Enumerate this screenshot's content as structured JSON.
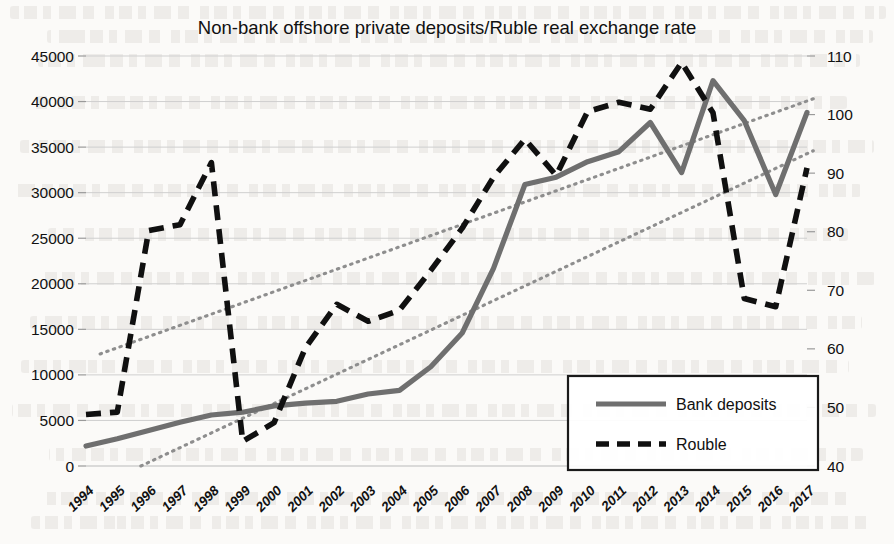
{
  "chart_data": {
    "type": "line",
    "title": "Non-bank offshore private deposits/Ruble real exchange rate",
    "xlabel": "",
    "ylabel": "",
    "grid": true,
    "legend_position": "bottom-right",
    "categories": [
      "1994",
      "1995",
      "1996",
      "1997",
      "1998",
      "1999",
      "2000",
      "2001",
      "2002",
      "2003",
      "2004",
      "2005",
      "2006",
      "2007",
      "2008",
      "2009",
      "2010",
      "2011",
      "2012",
      "2013",
      "2014",
      "2015",
      "2016",
      "2017"
    ],
    "y_left": {
      "label": "",
      "ticks": [
        "0",
        "5000",
        "10000",
        "15000",
        "20000",
        "25000",
        "30000",
        "35000",
        "40000",
        "45000"
      ],
      "lim": [
        0,
        45000
      ]
    },
    "y_right": {
      "label": "",
      "ticks": [
        "40",
        "50",
        "60",
        "70",
        "80",
        "90",
        "100",
        "110"
      ],
      "lim": [
        40,
        110
      ]
    },
    "series": [
      {
        "name": "Bank deposits",
        "axis": "left",
        "style": "solid",
        "color": "#6f6f6f",
        "values": [
          2200,
          3000,
          3900,
          4800,
          5600,
          5900,
          6600,
          6900,
          7100,
          7900,
          8300,
          10900,
          14600,
          21700,
          30900,
          31700,
          33400,
          34500,
          37700,
          32200,
          42300,
          37900,
          29800,
          38800
        ]
      },
      {
        "name": "Rouble",
        "axis": "right",
        "style": "dashed",
        "color": "#101010",
        "values": [
          48.8,
          49.2,
          80.2,
          81.2,
          91.8,
          44.2,
          47.4,
          60.2,
          67.6,
          64.7,
          66.6,
          73.4,
          80.6,
          89.3,
          95.8,
          89.6,
          100.5,
          102.1,
          100.9,
          108.9,
          100.3,
          68.6,
          67.2,
          90.9
        ]
      }
    ],
    "trendlines": [
      {
        "name": "trend-upper",
        "style": "dotted",
        "color": "#8e8e8e",
        "axis": "left",
        "from": {
          "x_index": 0.45,
          "value": 12300
        },
        "to": {
          "x_index": 23.2,
          "value": 40300
        }
      },
      {
        "name": "trend-lower",
        "style": "dotted",
        "color": "#8e8e8e",
        "axis": "left",
        "from": {
          "x_index": 1.75,
          "value": 0
        },
        "to": {
          "x_index": 23.2,
          "value": 34600
        }
      }
    ],
    "legend": [
      {
        "label": "Bank deposits",
        "style": "solid",
        "color": "#6f6f6f"
      },
      {
        "label": "Rouble",
        "style": "dashed",
        "color": "#101010"
      }
    ]
  },
  "colors": {
    "deposits": "#6f6f6f",
    "rouble": "#101010",
    "trend": "#8e8e8e",
    "grid": "#cfcfcf",
    "page": "#fbfaf8"
  }
}
